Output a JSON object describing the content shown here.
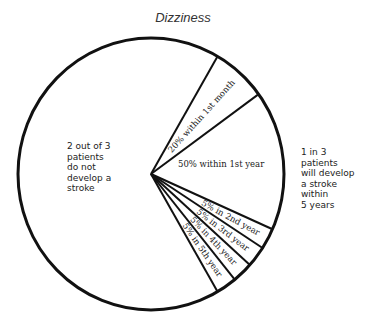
{
  "chart_data": {
    "type": "pie",
    "title": "Dizziness",
    "slices": [
      {
        "label": "2 out of 3 patients do not develop a stroke",
        "value": 66.7,
        "group": "no-stroke"
      },
      {
        "label": "20% within 1st month",
        "value": 20,
        "group": "stroke"
      },
      {
        "label": "50% within 1st year",
        "value": 50,
        "group": "stroke"
      },
      {
        "label": "5% in 2nd year",
        "value": 5,
        "group": "stroke"
      },
      {
        "label": "5% in 3rd year",
        "value": 5,
        "group": "stroke"
      },
      {
        "label": "5% in 4th year",
        "value": 5,
        "group": "stroke"
      },
      {
        "label": "5% in 5th year",
        "value": 5,
        "group": "stroke"
      }
    ],
    "group_fractions": {
      "no-stroke": 0.667,
      "stroke": 0.333
    },
    "annotations": {
      "left": [
        "2 out of 3",
        "patients",
        "do not",
        "develop a",
        "stroke"
      ],
      "right": [
        "1 in 3",
        "patients",
        "will develop",
        "a stroke",
        "within",
        "5 years"
      ]
    }
  }
}
